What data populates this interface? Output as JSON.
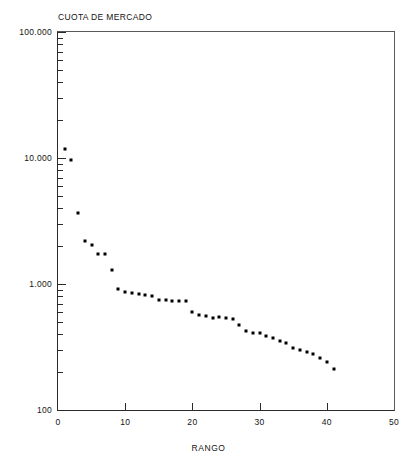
{
  "chart_data": {
    "type": "scatter",
    "title": "CUOTA DE MERCADO",
    "xlabel": "RANGO",
    "ylabel": "",
    "yscale": "log",
    "xlim": [
      0,
      50
    ],
    "ylim": [
      0.1,
      100.0
    ],
    "grid": false,
    "legend": null,
    "marker": "square",
    "marker_color": "#000000",
    "xticks": [
      "0",
      "10",
      "20",
      "30",
      "40",
      "50"
    ],
    "xtick_values": [
      0,
      10,
      20,
      30,
      40,
      50
    ],
    "yticks": [
      "100.000",
      "10.000",
      "1.000",
      "100"
    ],
    "ytick_values": [
      100.0,
      10.0,
      1.0,
      0.1
    ],
    "x": [
      1,
      2,
      3,
      4,
      5,
      6,
      7,
      8,
      9,
      10,
      11,
      12,
      13,
      14,
      15,
      16,
      17,
      18,
      19,
      20,
      21,
      22,
      23,
      24,
      25,
      26,
      27,
      28,
      29,
      30,
      31,
      32,
      33,
      34,
      35,
      36,
      37,
      38,
      39,
      40,
      41
    ],
    "values": [
      11.8,
      9.7,
      3.65,
      2.2,
      2.05,
      1.72,
      1.72,
      1.28,
      0.92,
      0.86,
      0.85,
      0.84,
      0.82,
      0.8,
      0.75,
      0.74,
      0.73,
      0.73,
      0.73,
      0.6,
      0.57,
      0.56,
      0.54,
      0.55,
      0.54,
      0.53,
      0.47,
      0.42,
      0.41,
      0.41,
      0.39,
      0.37,
      0.35,
      0.34,
      0.31,
      0.3,
      0.29,
      0.28,
      0.26,
      0.24,
      0.21
    ]
  }
}
